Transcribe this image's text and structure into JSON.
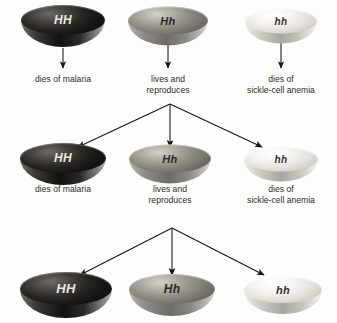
{
  "diagram": {
    "background_color": "#fdfdfc",
    "line_color": "#1a1a1a",
    "text_color": "#2e2c29",
    "genotype_styles": {
      "HH": {
        "shade": "dark",
        "fill": "#262420",
        "label_color": "#e9e7e2"
      },
      "Hh": {
        "shade": "medium-gray",
        "fill": "#9e9a94",
        "label_color": "#2a2824"
      },
      "hh": {
        "shade": "light",
        "fill": "#f2efeb",
        "label_color": "#35322e"
      }
    },
    "generations": [
      {
        "row": 1,
        "individuals": [
          {
            "genotype": "HH",
            "outcome": "dies of malaria",
            "outcome_lines": [
              "dies of malaria"
            ],
            "reproduces": false,
            "disc": {
              "cx": 63,
              "cy": 26,
              "w": 84,
              "h": 30
            },
            "caption": {
              "cx": 63,
              "top": 74
            }
          },
          {
            "genotype": "Hh",
            "outcome": "lives and reproduces",
            "outcome_lines": [
              "lives and",
              "reproduces"
            ],
            "reproduces": true,
            "disc": {
              "cx": 168,
              "cy": 26,
              "w": 80,
              "h": 28
            },
            "caption": {
              "cx": 168,
              "top": 74
            }
          },
          {
            "genotype": "hh",
            "outcome": "dies of sickle-cell anemia",
            "outcome_lines": [
              "dies of",
              "sickle-cell anemia"
            ],
            "reproduces": false,
            "disc": {
              "cx": 281,
              "cy": 26,
              "w": 72,
              "h": 25
            },
            "caption": {
              "cx": 281,
              "top": 74
            }
          }
        ]
      },
      {
        "row": 2,
        "individuals": [
          {
            "genotype": "HH",
            "outcome": "dies of malaria",
            "outcome_lines": [
              "dies of malaria"
            ],
            "reproduces": false,
            "disc": {
              "cx": 63,
              "cy": 164,
              "w": 86,
              "h": 30
            },
            "caption": {
              "cx": 63,
              "top": 184
            }
          },
          {
            "genotype": "Hh",
            "outcome": "lives and reproduces",
            "outcome_lines": [
              "lives and",
              "reproduces"
            ],
            "reproduces": true,
            "disc": {
              "cx": 170,
              "cy": 164,
              "w": 82,
              "h": 28
            },
            "caption": {
              "cx": 170,
              "top": 184
            }
          },
          {
            "genotype": "hh",
            "outcome": "dies of sickle-cell anemia",
            "outcome_lines": [
              "dies of",
              "sickle-cell anemia"
            ],
            "reproduces": false,
            "disc": {
              "cx": 281,
              "cy": 164,
              "w": 74,
              "h": 25
            },
            "caption": {
              "cx": 281,
              "top": 184
            }
          }
        ]
      },
      {
        "row": 3,
        "individuals": [
          {
            "genotype": "HH",
            "outcome": "",
            "outcome_lines": [],
            "reproduces": false,
            "disc": {
              "cx": 66,
              "cy": 295,
              "w": 92,
              "h": 33
            },
            "caption": null
          },
          {
            "genotype": "Hh",
            "outcome": "",
            "outcome_lines": [],
            "reproduces": false,
            "disc": {
              "cx": 172,
              "cy": 295,
              "w": 86,
              "h": 30
            },
            "caption": null
          },
          {
            "genotype": "hh",
            "outcome": "",
            "outcome_lines": [],
            "reproduces": false,
            "disc": {
              "cx": 283,
              "cy": 295,
              "w": 78,
              "h": 27
            },
            "caption": null
          }
        ]
      }
    ],
    "connectors": {
      "generation1_straight_arrows": [
        {
          "from_genotype": "HH",
          "x": 63,
          "y1": 48,
          "y2": 68
        },
        {
          "from_genotype": "Hh",
          "x": 168,
          "y1": 45,
          "y2": 68
        },
        {
          "from_genotype": "hh",
          "x": 281,
          "y1": 42,
          "y2": 68
        }
      ],
      "fans": [
        {
          "label": "first-cross-fan",
          "apex": {
            "x": 170,
            "y": 104
          },
          "targets": [
            {
              "genotype": "HH",
              "x": 78,
              "y": 147
            },
            {
              "genotype": "Hh",
              "x": 170,
              "y": 147
            },
            {
              "genotype": "hh",
              "x": 262,
              "y": 147
            }
          ]
        },
        {
          "label": "second-cross-fan",
          "apex": {
            "x": 172,
            "y": 228
          },
          "targets": [
            {
              "genotype": "HH",
              "x": 80,
              "y": 275
            },
            {
              "genotype": "Hh",
              "x": 172,
              "y": 275
            },
            {
              "genotype": "hh",
              "x": 264,
              "y": 275
            }
          ]
        }
      ]
    }
  }
}
